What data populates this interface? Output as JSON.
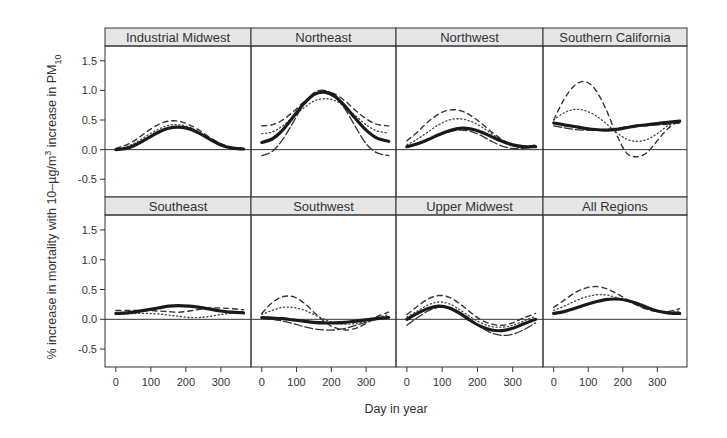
{
  "chart_data": {
    "type": "line",
    "layout": {
      "rows": 2,
      "cols": 4,
      "grid": false,
      "legend": "none"
    },
    "xlabel": "Day in year",
    "ylabel_parts": {
      "prefix": "% increase in mortality with 10–µg/m",
      "superscript": "3",
      "middle": " increase in PM",
      "subscript": "10"
    },
    "xlim": [
      -31,
      386
    ],
    "ylim": [
      -0.8,
      1.75
    ],
    "xticks": [
      0,
      100,
      200,
      300
    ],
    "xtick_labels": [
      "0",
      "100",
      "200",
      "300"
    ],
    "yticks": [
      -0.5,
      0.0,
      0.5,
      1.0,
      1.5
    ],
    "ytick_labels": [
      "-0.5",
      "0.0",
      "0.5",
      "1.0",
      "1.5"
    ],
    "x": [
      0,
      30,
      60,
      90,
      120,
      150,
      180,
      210,
      240,
      270,
      300,
      330,
      365
    ],
    "panels": [
      {
        "title": "Industrial Midwest",
        "series": [
          {
            "name": "estimate",
            "style": "thick",
            "values": [
              0.0,
              0.02,
              0.09,
              0.19,
              0.29,
              0.36,
              0.38,
              0.35,
              0.27,
              0.17,
              0.08,
              0.03,
              0.01
            ]
          },
          {
            "name": "dashed",
            "style": "dashed",
            "values": [
              0.02,
              0.08,
              0.18,
              0.31,
              0.42,
              0.48,
              0.48,
              0.42,
              0.32,
              0.2,
              0.1,
              0.04,
              0.02
            ]
          },
          {
            "name": "dotted",
            "style": "dotted",
            "values": [
              0.01,
              0.05,
              0.13,
              0.24,
              0.34,
              0.41,
              0.42,
              0.38,
              0.29,
              0.18,
              0.09,
              0.03,
              0.01
            ]
          }
        ]
      },
      {
        "title": "Northeast",
        "series": [
          {
            "name": "estimate",
            "style": "thick",
            "values": [
              0.12,
              0.18,
              0.33,
              0.55,
              0.77,
              0.93,
              0.97,
              0.9,
              0.73,
              0.52,
              0.33,
              0.2,
              0.14
            ]
          },
          {
            "name": "dashed",
            "style": "dashed",
            "values": [
              0.4,
              0.42,
              0.5,
              0.64,
              0.8,
              0.93,
              0.98,
              0.94,
              0.82,
              0.66,
              0.52,
              0.43,
              0.4
            ]
          },
          {
            "name": "dotted",
            "style": "dotted",
            "values": [
              0.27,
              0.3,
              0.4,
              0.55,
              0.7,
              0.82,
              0.86,
              0.83,
              0.72,
              0.57,
              0.42,
              0.32,
              0.28
            ]
          },
          {
            "name": "dashed2",
            "style": "longdash",
            "values": [
              -0.1,
              -0.03,
              0.17,
              0.46,
              0.76,
              0.96,
              1.0,
              0.91,
              0.68,
              0.38,
              0.1,
              -0.05,
              -0.1
            ]
          }
        ]
      },
      {
        "title": "Northwest",
        "series": [
          {
            "name": "estimate",
            "style": "thick",
            "values": [
              0.05,
              0.1,
              0.17,
              0.25,
              0.32,
              0.36,
              0.35,
              0.3,
              0.22,
              0.14,
              0.08,
              0.05,
              0.05
            ]
          },
          {
            "name": "dashed",
            "style": "dashed",
            "values": [
              0.15,
              0.3,
              0.47,
              0.6,
              0.67,
              0.66,
              0.58,
              0.45,
              0.3,
              0.17,
              0.08,
              0.05,
              0.08
            ]
          },
          {
            "name": "dotted",
            "style": "dotted",
            "values": [
              0.08,
              0.18,
              0.3,
              0.42,
              0.5,
              0.52,
              0.48,
              0.39,
              0.27,
              0.15,
              0.07,
              0.04,
              0.06
            ]
          },
          {
            "name": "dashed2",
            "style": "longdash",
            "values": [
              0.04,
              0.09,
              0.16,
              0.24,
              0.3,
              0.33,
              0.31,
              0.24,
              0.14,
              0.06,
              0.02,
              0.02,
              0.05
            ]
          }
        ]
      },
      {
        "title": "Southern California",
        "series": [
          {
            "name": "estimate",
            "style": "thick",
            "values": [
              0.45,
              0.42,
              0.39,
              0.36,
              0.34,
              0.33,
              0.34,
              0.37,
              0.4,
              0.42,
              0.44,
              0.46,
              0.48
            ]
          },
          {
            "name": "dashed",
            "style": "dashed",
            "values": [
              0.5,
              0.85,
              1.08,
              1.15,
              1.02,
              0.7,
              0.28,
              -0.05,
              -0.12,
              -0.05,
              0.15,
              0.35,
              0.5
            ]
          },
          {
            "name": "dotted",
            "style": "dotted",
            "values": [
              0.5,
              0.62,
              0.68,
              0.66,
              0.58,
              0.45,
              0.3,
              0.18,
              0.14,
              0.17,
              0.27,
              0.4,
              0.5
            ]
          },
          {
            "name": "dashed2",
            "style": "longdash",
            "values": [
              0.4,
              0.37,
              0.34,
              0.33,
              0.33,
              0.34,
              0.36,
              0.38,
              0.4,
              0.41,
              0.42,
              0.43,
              0.45
            ]
          }
        ]
      },
      {
        "title": "Southeast",
        "series": [
          {
            "name": "estimate",
            "style": "thick",
            "values": [
              0.1,
              0.11,
              0.13,
              0.16,
              0.19,
              0.22,
              0.23,
              0.22,
              0.2,
              0.17,
              0.14,
              0.12,
              0.11
            ]
          },
          {
            "name": "dashed",
            "style": "dashed",
            "values": [
              0.15,
              0.15,
              0.15,
              0.15,
              0.14,
              0.13,
              0.12,
              0.14,
              0.17,
              0.19,
              0.19,
              0.18,
              0.16
            ]
          },
          {
            "name": "dotted",
            "style": "dotted",
            "values": [
              0.08,
              0.09,
              0.1,
              0.1,
              0.09,
              0.07,
              0.05,
              0.03,
              0.03,
              0.05,
              0.08,
              0.1,
              0.1
            ]
          }
        ]
      },
      {
        "title": "Southwest",
        "series": [
          {
            "name": "estimate",
            "style": "thick",
            "values": [
              0.03,
              0.02,
              0.01,
              -0.01,
              -0.03,
              -0.05,
              -0.06,
              -0.06,
              -0.05,
              -0.03,
              -0.01,
              0.01,
              0.03
            ]
          },
          {
            "name": "dashed",
            "style": "dashed",
            "values": [
              0.1,
              0.28,
              0.38,
              0.38,
              0.28,
              0.12,
              -0.04,
              -0.14,
              -0.18,
              -0.15,
              -0.07,
              0.04,
              0.12
            ]
          },
          {
            "name": "dotted",
            "style": "dotted",
            "values": [
              0.08,
              0.15,
              0.2,
              0.2,
              0.16,
              0.08,
              0.0,
              -0.06,
              -0.08,
              -0.07,
              -0.03,
              0.02,
              0.08
            ]
          },
          {
            "name": "dashed2",
            "style": "longdash",
            "values": [
              0.02,
              0.0,
              -0.03,
              -0.07,
              -0.12,
              -0.16,
              -0.18,
              -0.18,
              -0.15,
              -0.1,
              -0.05,
              0.0,
              0.04
            ]
          }
        ]
      },
      {
        "title": "Upper Midwest",
        "series": [
          {
            "name": "estimate",
            "style": "thick",
            "values": [
              0.0,
              0.1,
              0.18,
              0.22,
              0.19,
              0.1,
              -0.02,
              -0.12,
              -0.18,
              -0.19,
              -0.15,
              -0.08,
              0.0
            ]
          },
          {
            "name": "dashed",
            "style": "dashed",
            "values": [
              0.08,
              0.22,
              0.34,
              0.4,
              0.37,
              0.26,
              0.12,
              -0.01,
              -0.08,
              -0.1,
              -0.06,
              0.02,
              0.1
            ]
          },
          {
            "name": "dotted",
            "style": "dotted",
            "values": [
              0.04,
              0.14,
              0.24,
              0.29,
              0.26,
              0.16,
              0.04,
              -0.06,
              -0.12,
              -0.13,
              -0.1,
              -0.03,
              0.05
            ]
          },
          {
            "name": "dashed2",
            "style": "longdash",
            "values": [
              -0.1,
              0.03,
              0.14,
              0.2,
              0.2,
              0.12,
              0.0,
              -0.13,
              -0.23,
              -0.27,
              -0.25,
              -0.18,
              -0.06
            ]
          }
        ]
      },
      {
        "title": "All Regions",
        "series": [
          {
            "name": "estimate",
            "style": "thick",
            "values": [
              0.1,
              0.13,
              0.18,
              0.24,
              0.29,
              0.33,
              0.34,
              0.32,
              0.27,
              0.2,
              0.14,
              0.11,
              0.1
            ]
          },
          {
            "name": "dashed",
            "style": "dashed",
            "values": [
              0.2,
              0.32,
              0.44,
              0.52,
              0.55,
              0.52,
              0.44,
              0.34,
              0.24,
              0.17,
              0.13,
              0.13,
              0.18
            ]
          },
          {
            "name": "dotted",
            "style": "dotted",
            "values": [
              0.15,
              0.22,
              0.3,
              0.37,
              0.41,
              0.41,
              0.37,
              0.31,
              0.24,
              0.17,
              0.13,
              0.12,
              0.14
            ]
          }
        ]
      }
    ]
  }
}
